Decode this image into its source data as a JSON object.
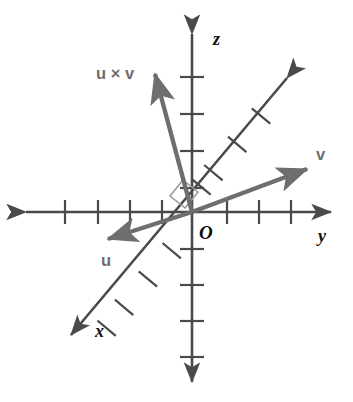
{
  "figure": {
    "background_color": "#ffffff",
    "width": 353,
    "height": 402
  },
  "colors": {
    "axis": "#4a4a4a",
    "vector": "#6e6e6e",
    "axis_label": "#111111",
    "vector_label": "#6e6e6e",
    "origin_label": "#0d0d0d",
    "right_angle": "#9a9a9a"
  },
  "origin": {
    "label": "O",
    "x": 192,
    "y": 212
  },
  "axes": [
    {
      "name": "x",
      "label": "x",
      "label_x": 95,
      "label_y": 337,
      "x1": 290,
      "y1": 74,
      "x2": 67,
      "y2": 339,
      "double_headed": true,
      "ticks_positive": 4,
      "ticks_negative": 4
    },
    {
      "name": "y",
      "label": "y",
      "label_x": 318,
      "label_y": 242,
      "x1": 22,
      "y1": 212,
      "x2": 335,
      "y2": 212,
      "double_headed": true,
      "ticks_positive": 3,
      "ticks_negative": 4
    },
    {
      "name": "z",
      "label": "z",
      "label_x": 213,
      "label_y": 45,
      "x1": 192,
      "y1": 30,
      "x2": 192,
      "y2": 386,
      "double_headed": true,
      "ticks_positive": 4,
      "ticks_negative": 4
    }
  ],
  "vectors": [
    {
      "name": "u-cross-v",
      "label": "u × v",
      "label_x": 96,
      "label_y": 79,
      "from_x": 192,
      "from_y": 212,
      "to_x": 153,
      "to_y": 68
    },
    {
      "name": "v",
      "label": "v",
      "label_x": 316,
      "label_y": 160,
      "from_x": 192,
      "from_y": 212,
      "to_x": 313,
      "to_y": 167
    },
    {
      "name": "u",
      "label": "u",
      "label_x": 101,
      "label_y": 266,
      "from_x": 192,
      "from_y": 212,
      "to_x": 102,
      "to_y": 241
    }
  ],
  "annotations": [
    {
      "name": "right-angle-marker",
      "type": "right-angle",
      "description": "square marker indicating u × v is perpendicular to the plane of u and v"
    }
  ]
}
